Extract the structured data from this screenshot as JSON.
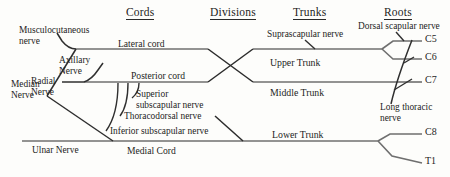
{
  "diagram": {
    "columns": [
      {
        "id": "cords",
        "label": "Cords"
      },
      {
        "id": "divisions",
        "label": "Divisions"
      },
      {
        "id": "trunks",
        "label": "Trunks"
      },
      {
        "id": "roots",
        "label": "Roots"
      }
    ],
    "terminal_nerves": [
      {
        "id": "musculocutaneous",
        "line1": "Musculocutaneous",
        "line2": "nerve"
      },
      {
        "id": "median",
        "line1": "Median",
        "line2": "Nerve"
      },
      {
        "id": "axillary",
        "line1": "Axillary",
        "line2": "Nerve"
      },
      {
        "id": "radial",
        "line1": "Radial",
        "line2": "Nerve"
      },
      {
        "id": "ulnar",
        "line1": "Ulnar Nerve",
        "line2": ""
      }
    ],
    "cords": [
      {
        "id": "lateral-cord",
        "label": "Lateral cord"
      },
      {
        "id": "posterior-cord",
        "label": "Posterior cord"
      },
      {
        "id": "medial-cord",
        "label": "Medial Cord"
      }
    ],
    "posterior_branches": [
      {
        "id": "superior-subscapular",
        "line1": "Superior",
        "line2": "subscapular nerve"
      },
      {
        "id": "thoracodorsal",
        "line1": "Thoracodorsal nerve",
        "line2": ""
      },
      {
        "id": "inferior-subscapular",
        "line1": "Inferior subscapular nerve",
        "line2": ""
      }
    ],
    "trunks": [
      {
        "id": "upper-trunk",
        "label": "Upper Trunk"
      },
      {
        "id": "middle-trunk",
        "label": "Middle Trunk"
      },
      {
        "id": "lower-trunk",
        "label": "Lower Trunk"
      }
    ],
    "root_branches": [
      {
        "id": "suprascapular",
        "line1": "Suprascapular nerve",
        "line2": ""
      },
      {
        "id": "dorsal-scapular",
        "line1": "Dorsal scapular nerve",
        "line2": ""
      },
      {
        "id": "long-thoracic",
        "line1": "Long thoracic",
        "line2": "nerve"
      }
    ],
    "roots": [
      {
        "id": "c5",
        "label": "C5"
      },
      {
        "id": "c6",
        "label": "C6"
      },
      {
        "id": "c7",
        "label": "C7"
      },
      {
        "id": "c8",
        "label": "C8"
      },
      {
        "id": "t1",
        "label": "T1"
      }
    ],
    "colors": {
      "line": "#6b6b6b",
      "line_dark": "#2b2b2b",
      "text": "#1d1d1d",
      "background": "#fdfdfb"
    }
  }
}
